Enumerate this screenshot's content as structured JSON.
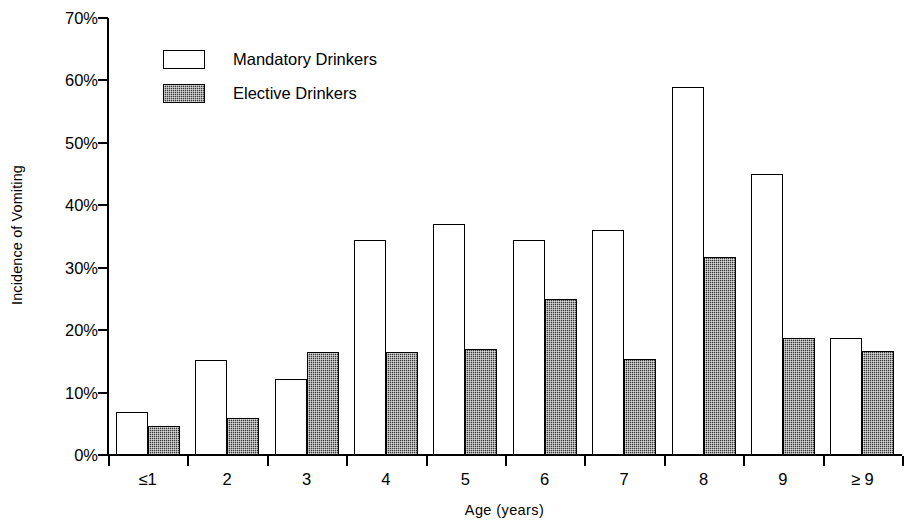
{
  "chart_data": {
    "type": "bar",
    "title": "",
    "xlabel": "Age  (years)",
    "ylabel": "Incidence of Vomiting",
    "categories": [
      "≤1",
      "2",
      "3",
      "4",
      "5",
      "6",
      "7",
      "8",
      "9",
      "≥ 9"
    ],
    "series": [
      {
        "name": "Mandatory  Drinkers",
        "fill": "white",
        "values": [
          6.9,
          15.2,
          12.2,
          34.5,
          37.0,
          34.5,
          36.0,
          59.0,
          45.0,
          18.7
        ]
      },
      {
        "name": "Elective  Drinkers",
        "fill": "dark-stipple",
        "values": [
          4.6,
          5.9,
          16.5,
          16.5,
          16.9,
          25.0,
          15.4,
          31.7,
          18.8,
          16.7
        ]
      }
    ],
    "ylim": [
      0,
      70
    ],
    "yticks": [
      0,
      10,
      20,
      30,
      40,
      50,
      60,
      70
    ],
    "ytick_labels": [
      "0%",
      "10%",
      "20%",
      "30%",
      "40%",
      "50%",
      "60%",
      "70%"
    ],
    "grid": false,
    "legend_position": "upper-left-inside",
    "colors": {
      "mandatory": "#ffffff",
      "elective": "#3b3b3b",
      "axis": "#000000",
      "background": "#ffffff"
    }
  }
}
